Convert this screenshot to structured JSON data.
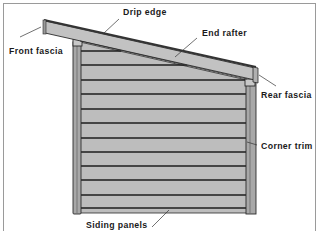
{
  "diagram": {
    "labels": {
      "drip_edge": "Drip edge",
      "front_fascia": "Front fascia",
      "end_rafter": "End rafter",
      "rear_fascia": "Rear fascia",
      "corner_trim": "Corner trim",
      "siding_panels": "Siding panels"
    },
    "colors": {
      "siding": "#bdbdbd",
      "trim": "#a8a8a8",
      "roof": "#c2c2c2",
      "outline": "#2a2a2a",
      "frame": "#9a9a9a",
      "background": "#ffffff"
    },
    "siding_line_count": 12
  }
}
